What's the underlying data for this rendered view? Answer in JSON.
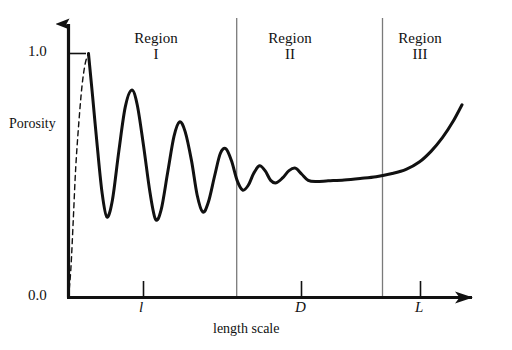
{
  "figure": {
    "y_axis": {
      "label": "Porosity",
      "ticks": [
        {
          "value": "1.0"
        },
        {
          "value": "0.0"
        }
      ]
    },
    "x_axis": {
      "label": "length scale",
      "ticks": [
        {
          "value": "l"
        },
        {
          "value": "D"
        },
        {
          "value": "L"
        }
      ]
    },
    "regions": [
      {
        "name": "Region",
        "numeral": "I"
      },
      {
        "name": "Region",
        "numeral": "II"
      },
      {
        "name": "Region",
        "numeral": "III"
      }
    ],
    "colors": {
      "axis": "#111111",
      "curve": "#111111",
      "divider": "#7a7a7a",
      "background": "#ffffff"
    }
  },
  "chart_data": {
    "type": "line",
    "title": "",
    "xlabel": "length scale",
    "ylabel": "Porosity",
    "xlim": [
      0,
      1
    ],
    "ylim": [
      0.0,
      1.0
    ],
    "grid": false,
    "legend": null,
    "xtick_labels": [
      "l",
      "D",
      "L"
    ],
    "ytick_labels": [
      "0.0",
      "1.0"
    ],
    "annotations": [
      {
        "text": "Region I",
        "region": 1
      },
      {
        "text": "Region II",
        "region": 2
      },
      {
        "text": "Region III",
        "region": 3
      }
    ],
    "series": [
      {
        "name": "porosity-dashed-rise",
        "style": "dashed",
        "points": [
          [
            0.0,
            0.0
          ],
          [
            0.006,
            0.12
          ],
          [
            0.012,
            0.32
          ],
          [
            0.018,
            0.53
          ],
          [
            0.026,
            0.72
          ],
          [
            0.034,
            0.87
          ],
          [
            0.042,
            0.96
          ],
          [
            0.05,
            1.0
          ]
        ]
      },
      {
        "name": "porosity-damped-oscillation",
        "style": "solid",
        "points": [
          [
            0.05,
            1.0
          ],
          [
            0.06,
            0.83
          ],
          [
            0.072,
            0.62
          ],
          [
            0.084,
            0.43
          ],
          [
            0.096,
            0.33
          ],
          [
            0.11,
            0.4
          ],
          [
            0.126,
            0.6
          ],
          [
            0.142,
            0.78
          ],
          [
            0.158,
            0.85
          ],
          [
            0.172,
            0.79
          ],
          [
            0.188,
            0.62
          ],
          [
            0.204,
            0.43
          ],
          [
            0.218,
            0.32
          ],
          [
            0.232,
            0.36
          ],
          [
            0.248,
            0.51
          ],
          [
            0.264,
            0.66
          ],
          [
            0.278,
            0.72
          ],
          [
            0.292,
            0.68
          ],
          [
            0.308,
            0.56
          ],
          [
            0.322,
            0.42
          ],
          [
            0.336,
            0.35
          ],
          [
            0.35,
            0.39
          ],
          [
            0.366,
            0.5
          ],
          [
            0.38,
            0.59
          ],
          [
            0.394,
            0.61
          ],
          [
            0.408,
            0.56
          ],
          [
            0.422,
            0.48
          ],
          [
            0.436,
            0.44
          ],
          [
            0.45,
            0.46
          ],
          [
            0.464,
            0.51
          ],
          [
            0.478,
            0.54
          ],
          [
            0.492,
            0.52
          ],
          [
            0.506,
            0.48
          ],
          [
            0.52,
            0.47
          ],
          [
            0.536,
            0.49
          ],
          [
            0.552,
            0.52
          ],
          [
            0.568,
            0.53
          ],
          [
            0.584,
            0.505
          ],
          [
            0.6,
            0.48
          ],
          [
            0.62,
            0.475
          ],
          [
            0.65,
            0.478
          ],
          [
            0.69,
            0.482
          ],
          [
            0.73,
            0.488
          ],
          [
            0.77,
            0.495
          ],
          [
            0.81,
            0.508
          ],
          [
            0.845,
            0.525
          ],
          [
            0.878,
            0.555
          ],
          [
            0.908,
            0.6
          ],
          [
            0.936,
            0.655
          ],
          [
            0.962,
            0.72
          ],
          [
            0.985,
            0.79
          ]
        ]
      }
    ],
    "dividers": [
      0.421,
      0.786
    ]
  }
}
